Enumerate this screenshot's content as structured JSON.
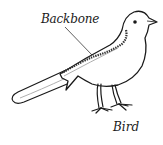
{
  "diagram": {
    "subject": "bird",
    "labels": {
      "backbone": "Backbone",
      "caption": "Bird"
    },
    "colors": {
      "ink": "#1a1a1a",
      "background": "#ffffff",
      "shading": "#9a9a9a"
    }
  }
}
